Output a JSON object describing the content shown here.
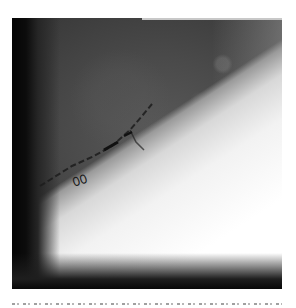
{
  "figure": {
    "type": "grayscale fluoroscopic image",
    "annotations": {
      "marker_text": "00"
    }
  },
  "caption": {
    "text": ""
  },
  "colors": {
    "background": "#ffffff",
    "dark_band": "#050505",
    "mid_tone": "#4a4a4a",
    "bright_region": "#ffffff"
  }
}
